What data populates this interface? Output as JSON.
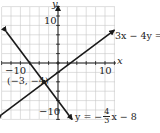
{
  "chart_data": {
    "type": "line",
    "title": "",
    "xlabel": "x",
    "ylabel": "y",
    "xlim": [
      -12,
      12
    ],
    "ylim": [
      -12,
      12
    ],
    "grid": true,
    "grid_step": 2,
    "tick_labels": {
      "x": [
        "-10",
        "10"
      ],
      "y": [
        "10",
        "-10"
      ]
    },
    "series": [
      {
        "name": "3x - 4y = 8",
        "equation": "y = (3/4)x - 2",
        "slope": 0.75,
        "intercept": -2,
        "x": [
          -12,
          12
        ],
        "y": [
          -11,
          7
        ]
      },
      {
        "name": "y = -4/3 x - 8",
        "equation": "y = -(4/3)x - 8",
        "slope": -1.3333,
        "intercept": -8,
        "x": [
          -11,
          3
        ],
        "y": [
          6.67,
          -12
        ]
      }
    ],
    "annotations": [
      {
        "text": "(-3, -4)",
        "x": -3,
        "y": -4,
        "type": "intersection-point"
      }
    ]
  },
  "labels": {
    "x_axis": "x",
    "y_axis": "y",
    "x_tick_neg": "−10",
    "x_tick_pos": "10",
    "y_tick_pos": "10",
    "y_tick_neg": "−10",
    "point": "(−3, −4)",
    "line1": "3x − 4y = 8",
    "line2_prefix": "y = −",
    "line2_num": "4",
    "line2_den": "3",
    "line2_suffix": "x − 8"
  }
}
